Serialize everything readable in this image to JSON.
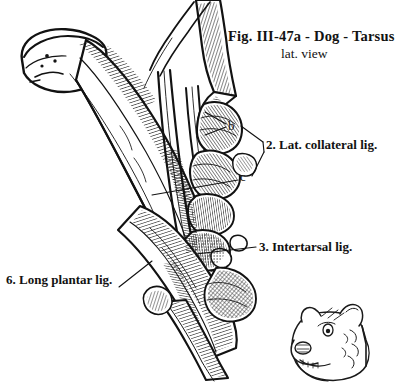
{
  "figure": {
    "title": "Fig. III-47a - Dog - Tarsus",
    "subtitle": "lat. view",
    "medium": "pen-and-ink line drawing",
    "ink_color": "#121212",
    "background_color": "#ffffff"
  },
  "labels": {
    "lat_collateral": "2. Lat. collateral lig.",
    "intertarsal": "3. Intertarsal lig.",
    "long_plantar": "6. Long plantar lig."
  },
  "markers": {
    "b": "b",
    "c": "c"
  },
  "inset": {
    "name": "dog-head-sketch"
  }
}
